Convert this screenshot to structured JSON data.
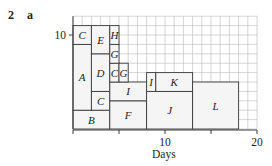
{
  "question": {
    "number": "2",
    "part": "a"
  },
  "chart_data": {
    "type": "resource histogram (stacked activity blocks)",
    "title": "",
    "xlabel": "Days",
    "ylabel": "No of workers",
    "xlim": [
      0,
      20
    ],
    "ylim": [
      0,
      12
    ],
    "x_ticks": [
      0,
      5,
      10,
      15,
      20
    ],
    "x_tick_labels": [
      "",
      "",
      "10",
      "",
      "20"
    ],
    "y_ticks": [
      10
    ],
    "y_tick_labels": [
      "10"
    ],
    "grid": true,
    "grid_step": 1,
    "blocks": [
      {
        "label": "B",
        "x0": 0,
        "x1": 4,
        "y0": 0,
        "y1": 2
      },
      {
        "label": "A",
        "x0": 0,
        "x1": 2,
        "y0": 2,
        "y1": 9
      },
      {
        "label": "C",
        "x0": 0,
        "x1": 2,
        "y0": 9,
        "y1": 11
      },
      {
        "label": "C",
        "x0": 2,
        "x1": 4,
        "y0": 2,
        "y1": 4
      },
      {
        "label": "D",
        "x0": 2,
        "x1": 4,
        "y0": 4,
        "y1": 8
      },
      {
        "label": "E",
        "x0": 2,
        "x1": 4,
        "y0": 8,
        "y1": 11
      },
      {
        "label": "F",
        "x0": 4,
        "x1": 8,
        "y0": 0,
        "y1": 3
      },
      {
        "label": "I",
        "x0": 4,
        "x1": 8,
        "y0": 3,
        "y1": 5
      },
      {
        "label": "C",
        "x0": 4,
        "x1": 5,
        "y0": 5,
        "y1": 7
      },
      {
        "label": "G",
        "x0": 5,
        "x1": 6,
        "y0": 5,
        "y1": 7
      },
      {
        "label": "G",
        "x0": 4,
        "x1": 5,
        "y0": 7,
        "y1": 9
      },
      {
        "label": "H",
        "x0": 4,
        "x1": 5,
        "y0": 9,
        "y1": 11
      },
      {
        "label": "J",
        "x0": 8,
        "x1": 13,
        "y0": 0,
        "y1": 4
      },
      {
        "label": "I",
        "x0": 8,
        "x1": 9,
        "y0": 4,
        "y1": 6
      },
      {
        "label": "K",
        "x0": 9,
        "x1": 13,
        "y0": 4,
        "y1": 6
      },
      {
        "label": "L",
        "x0": 13,
        "x1": 18,
        "y0": 0,
        "y1": 5
      }
    ]
  },
  "style": {
    "grid_color": "#b9b9b9",
    "block_fill": "#f5f5f5",
    "block_stroke": "#3a3a3a",
    "axis_color": "#3a3a3a"
  }
}
